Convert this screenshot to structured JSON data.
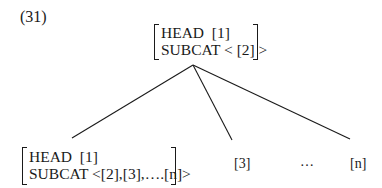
{
  "example_number": "(31)",
  "root": {
    "head_label": "HEAD",
    "head_value": "[1]",
    "subcat_label": "SUBCAT",
    "subcat_value": "< [2] >"
  },
  "children": {
    "head_daughter": {
      "head_label": "HEAD",
      "head_value": "[1]",
      "subcat_label": "SUBCAT",
      "subcat_value": "<[2],[3],….[n]>"
    },
    "complement_3": "[3]",
    "ellipsis": "…",
    "complement_n": "[n]"
  }
}
